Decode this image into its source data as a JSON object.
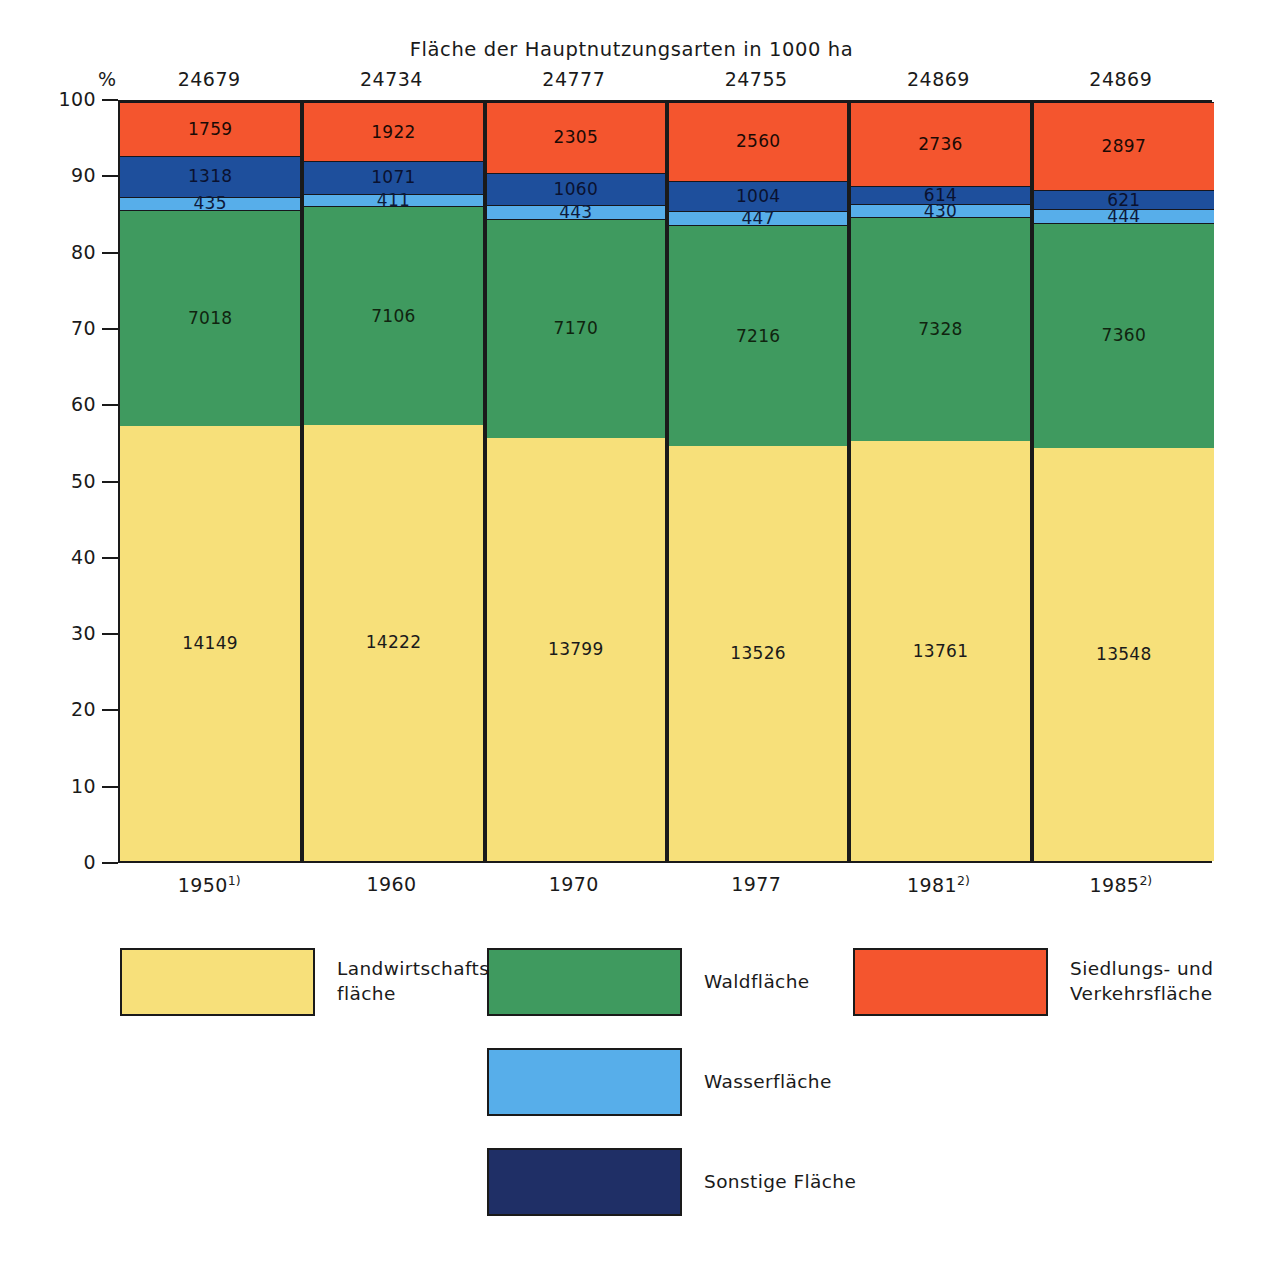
{
  "chart_data": {
    "type": "bar",
    "title": "Fläche der Hauptnutzungsarten in 1000 ha",
    "subtitle": "",
    "xlabel": "",
    "ylabel": "%",
    "ylim": [
      0,
      100
    ],
    "yticks": [
      0,
      10,
      20,
      30,
      40,
      50,
      60,
      70,
      80,
      90,
      100
    ],
    "ytick_labels": [
      "0",
      "10",
      "20",
      "30",
      "40",
      "50",
      "60",
      "70",
      "80",
      "90",
      "100"
    ],
    "grid": false,
    "stacked": true,
    "normalized_percent": true,
    "legend_position": "bottom",
    "categories": [
      "1950",
      "1960",
      "1970",
      "1977",
      "1981",
      "1985"
    ],
    "category_labels": [
      {
        "year": "1950",
        "footnote": "1)"
      },
      {
        "year": "1960",
        "footnote": ""
      },
      {
        "year": "1970",
        "footnote": ""
      },
      {
        "year": "1977",
        "footnote": ""
      },
      {
        "year": "1981",
        "footnote": "2)"
      },
      {
        "year": "1985",
        "footnote": "2)"
      }
    ],
    "column_totals": [
      "24679",
      "24734",
      "24777",
      "24755",
      "24869",
      "24869"
    ],
    "unit_symbol": "%",
    "series": [
      {
        "name": "Landwirtschaftsfläche",
        "color": "#f7e07a",
        "values": [
          14149,
          14222,
          13799,
          13526,
          13761,
          13548
        ],
        "labels": [
          "14149",
          "14222",
          "13799",
          "13526",
          "13761",
          "13548"
        ]
      },
      {
        "name": "Waldfläche",
        "color": "#3f9a5f",
        "values": [
          7018,
          7106,
          7170,
          7216,
          7328,
          7360
        ],
        "labels": [
          "7018",
          "7106",
          "7170",
          "7216",
          "7328",
          "7360"
        ]
      },
      {
        "name": "Wasserfläche",
        "color": "#57aeea",
        "values": [
          435,
          411,
          443,
          447,
          430,
          444
        ],
        "labels": [
          "435",
          "411",
          "443",
          "447",
          "430",
          "444"
        ]
      },
      {
        "name": "Sonstige Fläche",
        "color": "#1e4f9c",
        "values": [
          1318,
          1071,
          1060,
          1004,
          614,
          621
        ],
        "labels": [
          "1318",
          "1071",
          "1060",
          "1004",
          "614",
          "621"
        ]
      },
      {
        "name": "Siedlungs- und Verkehrsfläche",
        "color": "#f4552e",
        "values": [
          1759,
          1922,
          2305,
          2560,
          2736,
          2897
        ],
        "labels": [
          "1759",
          "1922",
          "2305",
          "2560",
          "2736",
          "2897"
        ]
      }
    ]
  },
  "legend": {
    "items": [
      {
        "key": "agri",
        "label": "Landwirtschafts-\nfläche",
        "color": "#f7e07a"
      },
      {
        "key": "wald",
        "label": "Waldfläche",
        "color": "#3f9a5f"
      },
      {
        "key": "siedl",
        "label": "Siedlungs-  und\nVerkehrsfläche",
        "color": "#f4552e"
      },
      {
        "key": "wasser",
        "label": "Wasserfläche",
        "color": "#57aeea"
      },
      {
        "key": "sonst",
        "label": "Sonstige Fläche",
        "color": "#1f2f66"
      }
    ]
  }
}
